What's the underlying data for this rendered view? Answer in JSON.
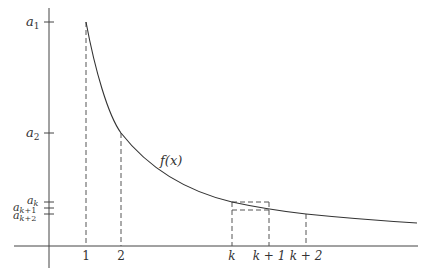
{
  "diagram": {
    "curve_label": "f(x)",
    "x_ticks": [
      {
        "label": "1",
        "x": 86
      },
      {
        "label": "2",
        "x": 121
      },
      {
        "label": "k",
        "x": 232
      },
      {
        "label": "k + 1",
        "x": 269
      },
      {
        "label": "k + 2",
        "x": 306
      }
    ],
    "y_ticks": [
      {
        "label": "a",
        "sub": "1",
        "y": 22
      },
      {
        "label": "a",
        "sub": "2",
        "y": 133
      },
      {
        "label": "a",
        "sub": "k",
        "y": 202
      },
      {
        "label": "a",
        "sub": "k+1",
        "y": 208
      },
      {
        "label": "a",
        "sub": "k+2",
        "y": 214
      }
    ],
    "colors": {
      "axis": "#444444",
      "curve": "#333333",
      "dashed": "#555555"
    }
  }
}
